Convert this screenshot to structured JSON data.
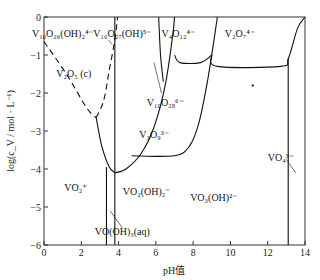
{
  "chart_data": {
    "type": "area",
    "title": "",
    "xlabel": "pH值",
    "ylabel": "log(c_V / mol · L⁻¹)",
    "xlim": [
      0,
      14
    ],
    "ylim": [
      -6,
      0
    ],
    "xticks": [
      0,
      2,
      4,
      6,
      8,
      10,
      12,
      14
    ],
    "yticks": [
      0,
      -1,
      -2,
      -3,
      -4,
      -5,
      -6
    ],
    "grid": false,
    "legend": "none",
    "regions": [
      {
        "name": "V10O26(OH)2 4-",
        "label": "V₁₀O₂₆(OH)₂⁴⁻",
        "pH": 1.0,
        "logc": -0.45
      },
      {
        "name": "V10O27(OH) 5-",
        "label": "V₁₀O₂₇(OH)⁵⁻",
        "pH": 4.2,
        "logc": -0.45
      },
      {
        "name": "V4O12 4-",
        "label": "V₄O₁₂⁴⁻",
        "pH": 7.2,
        "logc": -0.45
      },
      {
        "name": "V2O7 4-",
        "label": "V₂O₇⁴⁻",
        "pH": 10.5,
        "logc": -0.45
      },
      {
        "name": "V2O5(c)",
        "label": "V₂O₅ (c)",
        "pH": 1.6,
        "logc": -1.5
      },
      {
        "name": "V10O28 6-",
        "label": "V₁₀O₂₈⁶⁻",
        "pH": 6.5,
        "logc": -2.25
      },
      {
        "name": "V3O9 3-",
        "label": "V₃O₉³⁻",
        "pH": 5.9,
        "logc": -3.1
      },
      {
        "name": "VO2+",
        "label": "VO₂⁺",
        "pH": 1.7,
        "logc": -4.5
      },
      {
        "name": "VO2(OH)2-",
        "label": "VO₂(OH)₂⁻",
        "pH": 5.5,
        "logc": -4.6
      },
      {
        "name": "VO3(OH) 2-",
        "label": "VO₃(OH)²⁻",
        "pH": 9.1,
        "logc": -4.75
      },
      {
        "name": "VO4 3-",
        "label": "VO₄³⁻",
        "pH": 12.7,
        "logc": -3.7
      },
      {
        "name": "VO(OH)3(aq)",
        "label": "VO(OH)₃(aq)",
        "pH": 4.2,
        "logc": -5.65
      }
    ],
    "boundaries": [
      {
        "name": "v2o5-solubility-left",
        "style": "dashed",
        "points": [
          [
            0,
            -0.65
          ],
          [
            1.2,
            -1.5
          ],
          [
            2.3,
            -2.4
          ],
          [
            2.8,
            -2.65
          ]
        ]
      },
      {
        "name": "v2o5-solubility-right",
        "style": "dashed",
        "points": [
          [
            2.8,
            -2.65
          ],
          [
            3.2,
            -2.2
          ],
          [
            3.5,
            -1.4
          ],
          [
            3.8,
            -0.6
          ],
          [
            3.95,
            0
          ]
        ]
      },
      {
        "name": "vo2-vooh3-boundary",
        "style": "solid",
        "points": [
          [
            3.35,
            -6
          ],
          [
            3.35,
            -3.95
          ]
        ]
      },
      {
        "name": "vooh3-vo2oh2-boundary",
        "style": "solid",
        "points": [
          [
            3.8,
            -6
          ],
          [
            3.8,
            -4.1
          ]
        ]
      },
      {
        "name": "decavanadate-parabola-left",
        "style": "solid",
        "points": [
          [
            2.8,
            -2.65
          ],
          [
            3.1,
            -3.4
          ],
          [
            3.5,
            -3.95
          ],
          [
            3.8,
            -4.1
          ]
        ]
      },
      {
        "name": "decavanadate-parabola-right",
        "style": "solid",
        "points": [
          [
            3.8,
            -4.1
          ],
          [
            4.4,
            -4.0
          ],
          [
            5.2,
            -3.6
          ],
          [
            5.9,
            -2.9
          ],
          [
            6.5,
            -1.8
          ],
          [
            6.9,
            -0.5
          ],
          [
            7.0,
            0
          ]
        ]
      },
      {
        "name": "v10o26-v10o27-boundary",
        "style": "solid",
        "points": [
          [
            3.8,
            -4.1
          ],
          [
            3.8,
            0
          ]
        ]
      },
      {
        "name": "v10o27-v10o28-boundary",
        "style": "solid",
        "points": [
          [
            6.15,
            0
          ],
          [
            6.25,
            -1.0
          ],
          [
            6.4,
            -1.7
          ]
        ]
      },
      {
        "name": "v3o9-upper-boundary",
        "style": "solid",
        "points": [
          [
            4.7,
            -3.65
          ],
          [
            7.0,
            -3.65
          ],
          [
            7.8,
            -3.4
          ],
          [
            8.3,
            -2.8
          ],
          [
            8.8,
            -1.6
          ],
          [
            9.3,
            0
          ]
        ]
      },
      {
        "name": "v4o12-v10o28-boundary",
        "style": "solid",
        "points": [
          [
            7.0,
            -1.0
          ],
          [
            7.3,
            -1.2
          ],
          [
            8.4,
            -1.2
          ],
          [
            9.0,
            -1.0
          ]
        ]
      },
      {
        "name": "v2o7-lower-boundary",
        "style": "solid",
        "points": [
          [
            9.0,
            -1.0
          ],
          [
            9.3,
            -1.3
          ],
          [
            12.7,
            -1.3
          ],
          [
            13.1,
            -1.1
          ],
          [
            13.6,
            -0.3
          ],
          [
            14,
            0
          ]
        ]
      },
      {
        "name": "vo3oh-vo4-boundary",
        "style": "solid",
        "points": [
          [
            13.1,
            -1.1
          ],
          [
            13.1,
            -6
          ]
        ]
      }
    ],
    "leaders": [
      {
        "name": "v10o26-leader",
        "from": [
          3.45,
          -0.6
        ],
        "to": [
          3.65,
          -0.72
        ]
      },
      {
        "name": "v10o28-leader",
        "from": [
          6.3,
          -2.0
        ],
        "to": [
          5.9,
          -1.2
        ]
      },
      {
        "name": "vooh3-leader",
        "from": [
          4.2,
          -5.55
        ],
        "to": [
          3.55,
          -5.1
        ]
      },
      {
        "name": "vo4-leader",
        "from": [
          13.0,
          -3.75
        ],
        "to": [
          13.5,
          -4.1
        ]
      }
    ],
    "annotations": [
      {
        "name": "dot-marker",
        "pH": 11.2,
        "logc": -1.8
      }
    ]
  }
}
